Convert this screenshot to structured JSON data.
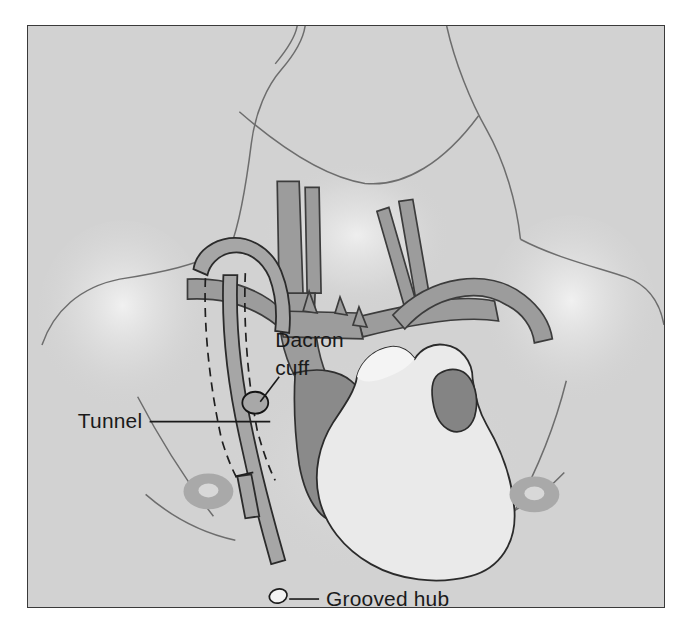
{
  "figure": {
    "kind": "medical-illustration",
    "panel_background_color": "#d2d2d2",
    "panel_border_color": "#3a3a3a",
    "page_background_color": "#ffffff"
  },
  "labels": [
    {
      "id": "dacron-cuff",
      "line1": "Dacron",
      "line2": "cuff",
      "text_x": 248,
      "text_y": 322,
      "anchor": "start",
      "leader": "M 252 352 L 233 377",
      "points_to": "subcutaneous cuff on catheter"
    },
    {
      "id": "tunnel",
      "line1": "Tunnel",
      "line2": "",
      "text_x": 50,
      "text_y": 403,
      "anchor": "start",
      "leader": "M 122 397 L 243 397",
      "points_to": "subcutaneous tunnel tract"
    },
    {
      "id": "grooved-hub",
      "line1": "Grooved hub",
      "line2": "",
      "text_x": 299,
      "text_y": 582,
      "anchor": "start",
      "leader": "M 262 575 L 292 575",
      "points_to": "external catheter hub"
    }
  ],
  "anatomy": {
    "items": [
      {
        "name": "neck-and-shoulders-outline",
        "color": "#6d6d6d"
      },
      {
        "name": "left-internal-jugular-vein",
        "color": "#9c9c9c"
      },
      {
        "name": "right-internal-jugular-vein",
        "color": "#9c9c9c"
      },
      {
        "name": "left-subclavian-vein",
        "color": "#9c9c9c"
      },
      {
        "name": "right-subclavian-vein",
        "color": "#9c9c9c"
      },
      {
        "name": "brachiocephalic-vein",
        "color": "#9c9c9c"
      },
      {
        "name": "superior-vena-cava",
        "color": "#8a8a8a"
      },
      {
        "name": "aortic-arch",
        "color": "#9c9c9c"
      },
      {
        "name": "heart",
        "color": "#eaeaea"
      },
      {
        "name": "pulmonary-artery",
        "color": "#848484"
      },
      {
        "name": "left-areola",
        "color": "#a9a9a9"
      },
      {
        "name": "right-areola",
        "color": "#a9a9a9"
      }
    ]
  },
  "device": {
    "name": "tunneled-central-venous-catheter",
    "catheter_color": "#a6a6a6",
    "cuff_color": "#a8a8a8",
    "hub_color": "#f2f2f2",
    "tunnel_line_style": "dashed"
  }
}
